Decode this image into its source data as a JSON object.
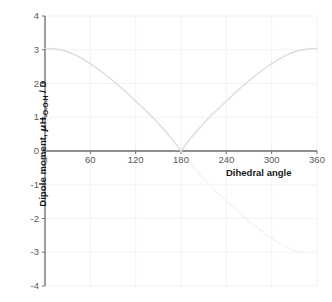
{
  "chart_data": {
    "type": "line",
    "title": "",
    "xlabel": "Dihedral angle",
    "ylabel": "Dipole moment, μH-O-O-H / D",
    "ylabel_parts": {
      "lead": "Dipole moment, ",
      "mu": "μ",
      "symbol": "H",
      "subscript": "-O-O-H",
      "units": " / D"
    },
    "xlim": [
      0,
      360
    ],
    "ylim": [
      -4,
      4
    ],
    "xticks": [
      "0",
      "60",
      "120",
      "180",
      "240",
      "300",
      "360"
    ],
    "xtick_values": [
      0,
      60,
      120,
      180,
      240,
      300,
      360
    ],
    "yticks": [
      "4",
      "3",
      "2",
      "1",
      "0",
      "-1",
      "-2",
      "-3",
      "-4"
    ],
    "ytick_values": [
      4,
      3,
      2,
      1,
      0,
      -1,
      -2,
      -3,
      -4
    ],
    "grid": true,
    "legend": "none",
    "series": [
      {
        "name": "|dipole moment|",
        "style": "solid",
        "color": "#d9d9d9",
        "x": [
          0,
          10,
          20,
          30,
          40,
          50,
          60,
          70,
          80,
          90,
          100,
          110,
          120,
          130,
          140,
          150,
          160,
          170,
          180,
          190,
          200,
          210,
          220,
          230,
          240,
          250,
          260,
          270,
          280,
          290,
          300,
          310,
          320,
          330,
          340,
          350,
          360
        ],
        "values": [
          3.04,
          3.03,
          3.0,
          2.94,
          2.85,
          2.73,
          2.59,
          2.43,
          2.26,
          2.08,
          1.89,
          1.69,
          1.48,
          1.27,
          1.05,
          0.82,
          0.57,
          0.3,
          0.0,
          0.3,
          0.57,
          0.82,
          1.05,
          1.27,
          1.48,
          1.69,
          1.89,
          2.08,
          2.26,
          2.43,
          2.59,
          2.73,
          2.85,
          2.94,
          3.0,
          3.03,
          3.04
        ]
      },
      {
        "name": "negative branch (faint)",
        "style": "faint",
        "color": "#f0f0f0",
        "x": [
          180,
          190,
          200,
          210,
          220,
          230,
          240,
          250,
          260,
          270,
          280,
          290,
          300,
          310,
          320,
          330,
          340,
          345
        ],
        "values": [
          0.0,
          -0.3,
          -0.57,
          -0.82,
          -1.05,
          -1.27,
          -1.48,
          -1.69,
          -1.89,
          -2.08,
          -2.26,
          -2.43,
          -2.59,
          -2.73,
          -2.85,
          -2.94,
          -3.0,
          -3.02
        ]
      }
    ]
  },
  "colors": {
    "axis": "#6e6e70",
    "grid": "#f2f2f2",
    "curve": "#dcdcdc",
    "curve_faint": "#f1f1f1",
    "tick_text": "#59595b",
    "label_text": "#1a1a1a",
    "background": "#ffffff"
  },
  "geometry": {
    "plot_left": 45,
    "plot_right": 317,
    "plot_top": 16,
    "plot_bottom": 286
  }
}
